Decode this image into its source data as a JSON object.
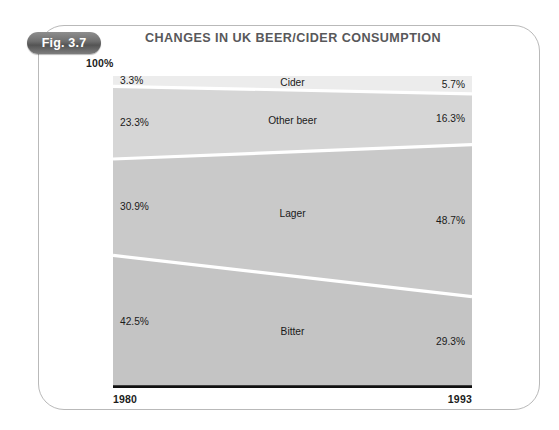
{
  "figure": {
    "badge_label": "Fig. 3.7",
    "title": "CHANGES IN UK BEER/CIDER CONSUMPTION",
    "axis_cap_label": "100%",
    "year_start_label": "1980",
    "year_end_label": "1993"
  },
  "colors": {
    "frame_stroke": "#b9b9b9",
    "badge_fill": "#6f6f6f",
    "badge_text": "#ffffff",
    "title_text": "#58585a",
    "axis_text": "#1c1c1c",
    "baseline": "#111111",
    "separator": "#ffffff",
    "cider_fill": "#ececec",
    "other_beer_fill": "#d6d6d6",
    "lager_fill": "#c9c9c9",
    "bitter_fill": "#c4c4c4"
  },
  "chart_data": {
    "type": "area",
    "title": "CHANGES IN UK BEER/CIDER CONSUMPTION",
    "subtitle": "",
    "xlabel": "",
    "ylabel": "",
    "stacked": true,
    "normalized_percent": true,
    "grid": false,
    "legend": "none",
    "x": [
      "1980",
      "1993"
    ],
    "xtick_labels": [
      "1980",
      "1993"
    ],
    "ytick_labels": [
      "100%"
    ],
    "ylim": [
      0,
      100
    ],
    "stack_order_top_to_bottom": [
      "Cider",
      "Other beer",
      "Lager",
      "Bitter"
    ],
    "series": [
      {
        "name": "Cider",
        "values": [
          3.3,
          5.7
        ],
        "labels": [
          "3.3%",
          "5.7%"
        ],
        "fill": "#ececec"
      },
      {
        "name": "Other beer",
        "values": [
          23.3,
          16.3
        ],
        "labels": [
          "23.3%",
          "16.3%"
        ],
        "fill": "#d6d6d6"
      },
      {
        "name": "Lager",
        "values": [
          30.9,
          48.7
        ],
        "labels": [
          "30.9%",
          "48.7%"
        ],
        "fill": "#c9c9c9"
      },
      {
        "name": "Bitter",
        "values": [
          42.5,
          29.3
        ],
        "labels": [
          "42.5%",
          "29.3%"
        ],
        "fill": "#c4c4c4"
      }
    ],
    "annotations": [
      {
        "text": "Cider",
        "position": "center"
      },
      {
        "text": "Other beer",
        "position": "center"
      },
      {
        "text": "Lager",
        "position": "center"
      },
      {
        "text": "Bitter",
        "position": "center"
      }
    ]
  },
  "labels": {
    "cider_name": "Cider",
    "cider_left": "3.3%",
    "cider_right": "5.7%",
    "other_beer_name": "Other beer",
    "other_beer_left": "23.3%",
    "other_beer_right": "16.3%",
    "lager_name": "Lager",
    "lager_left": "30.9%",
    "lager_right": "48.7%",
    "bitter_name": "Bitter",
    "bitter_left": "42.5%",
    "bitter_right": "29.3%"
  }
}
